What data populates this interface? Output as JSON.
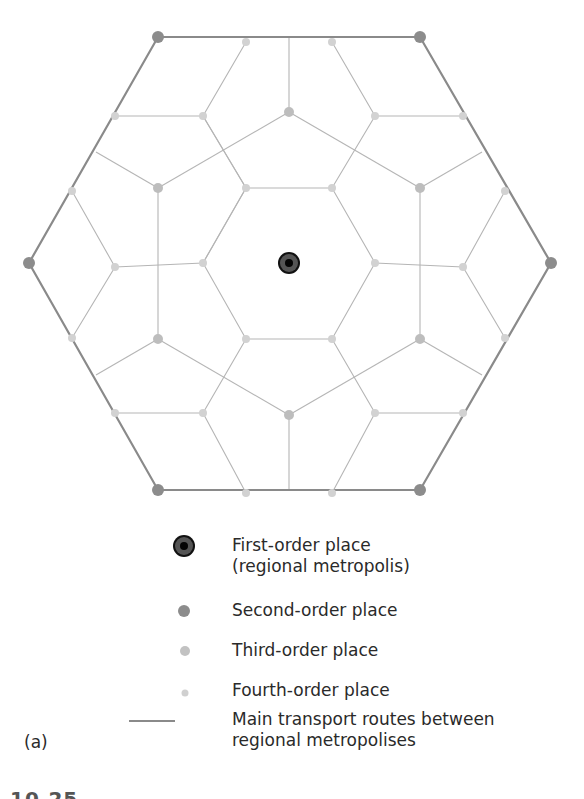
{
  "figure": {
    "panel_label": "(a)",
    "caption_fragment": "10.25"
  },
  "legend": {
    "items": [
      {
        "symbol": "first-order-place-icon",
        "line1": "First-order place",
        "line2": "(regional metropolis)"
      },
      {
        "symbol": "second-order-place-icon",
        "line1": "Second-order place"
      },
      {
        "symbol": "third-order-place-icon",
        "line1": "Third-order place"
      },
      {
        "symbol": "fourth-order-place-icon",
        "line1": "Fourth-order place"
      },
      {
        "symbol": "transport-route-icon",
        "line1": "Main transport routes between",
        "line2": "regional metropolises"
      }
    ]
  },
  "colors": {
    "first_order_outer": "#555555",
    "first_order_inner": "#111111",
    "second_order": "#8c8c8c",
    "third_order": "#b9b9b9",
    "fourth_order": "#d2d2d2",
    "main_route": "#8a8a8a",
    "minor_route": "#b5b5b5"
  },
  "network": {
    "center": [
      289,
      263
    ],
    "second_order": [
      [
        158,
        37
      ],
      [
        420,
        37
      ],
      [
        551,
        263
      ],
      [
        420,
        490
      ],
      [
        158,
        490
      ],
      [
        29,
        263
      ]
    ],
    "third_order": [
      [
        158,
        188
      ],
      [
        289,
        112
      ],
      [
        420,
        188
      ],
      [
        420,
        339
      ],
      [
        289,
        415
      ],
      [
        158,
        339
      ]
    ],
    "fourth_order": [
      [
        246,
        188
      ],
      [
        332,
        188
      ],
      [
        375,
        263
      ],
      [
        332,
        339
      ],
      [
        246,
        339
      ],
      [
        203,
        263
      ],
      [
        246,
        42
      ],
      [
        332,
        42
      ],
      [
        115,
        116
      ],
      [
        203,
        116
      ],
      [
        375,
        116
      ],
      [
        463,
        116
      ],
      [
        72,
        191
      ],
      [
        505,
        191
      ],
      [
        72,
        338
      ],
      [
        505,
        338
      ],
      [
        115,
        413
      ],
      [
        203,
        413
      ],
      [
        375,
        413
      ],
      [
        463,
        413
      ],
      [
        246,
        493
      ],
      [
        332,
        493
      ],
      [
        115,
        267
      ],
      [
        463,
        267
      ]
    ]
  }
}
